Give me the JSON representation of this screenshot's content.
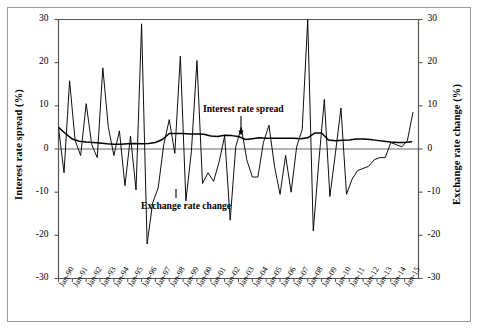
{
  "chart_data": {
    "type": "line",
    "title": "",
    "xlabel": "",
    "ylabel": "Interest rate spread (%)",
    "y2label": "Exchange rate change (%)",
    "ylim": [
      -30,
      30
    ],
    "y2lim": [
      -30,
      30
    ],
    "yticks": [
      30,
      20,
      10,
      0,
      -10,
      -20,
      -30
    ],
    "y2ticks": [
      30,
      20,
      10,
      0,
      -10,
      -20,
      -30
    ],
    "grid": false,
    "legend_position": "inline-annotations",
    "categories": [
      "Jan-90",
      "Jan-91",
      "Jan-92",
      "Jan-93",
      "Jan-94",
      "Jan-95",
      "Jan-96",
      "Jan-97",
      "Jan-98",
      "Jan-99",
      "Jan-00",
      "Jan-01",
      "Jan-02",
      "Jan-03",
      "Jan-04",
      "Jan-05",
      "Jan-06",
      "Jan-07",
      "Jan-08",
      "Jan-09",
      "Jan-10",
      "Jan-11",
      "Jan-12",
      "Jan-13",
      "Jan-14",
      "Jan-15"
    ],
    "annotations": [
      {
        "text": "Interest rate spread",
        "series": "Interest rate spread",
        "x": "Jan-03",
        "marker": "down-arrow"
      },
      {
        "text": "Exchange rate change",
        "series": "Exchange rate change",
        "x": "Jan-96",
        "marker": "tick"
      }
    ],
    "series": [
      {
        "name": "Interest rate spread",
        "axis": "left",
        "color": "#000000",
        "x": [
          1990.0,
          1990.5,
          1991.0,
          1991.5,
          1992.0,
          1992.5,
          1993.0,
          1993.5,
          1994.0,
          1994.5,
          1995.0,
          1995.5,
          1996.0,
          1996.5,
          1997.0,
          1997.5,
          1998.0,
          1998.5,
          1999.0,
          1999.5,
          2000.0,
          2000.5,
          2001.0,
          2001.5,
          2002.0,
          2002.5,
          2003.0,
          2003.5,
          2004.0,
          2004.5,
          2005.0,
          2005.5,
          2006.0,
          2006.5,
          2007.0,
          2007.5,
          2008.0,
          2008.5,
          2009.0,
          2009.5,
          2010.0,
          2010.5,
          2011.0,
          2011.5,
          2012.0,
          2012.5,
          2013.0,
          2013.5,
          2014.0,
          2014.5,
          2015.0,
          2015.5
        ],
        "values": [
          5.0,
          3.6,
          2.3,
          1.8,
          1.6,
          1.5,
          1.4,
          1.2,
          1.1,
          1.1,
          1.2,
          1.3,
          1.2,
          1.3,
          1.5,
          2.2,
          3.6,
          3.6,
          3.6,
          3.5,
          3.5,
          3.4,
          3.0,
          2.9,
          3.2,
          3.1,
          2.9,
          2.2,
          2.4,
          2.6,
          2.5,
          2.5,
          2.5,
          2.5,
          2.5,
          2.4,
          2.6,
          3.7,
          3.7,
          2.1,
          1.9,
          2.0,
          2.1,
          2.3,
          2.3,
          2.2,
          2.0,
          1.8,
          1.6,
          1.5,
          1.5,
          1.7
        ]
      },
      {
        "name": "Exchange rate change",
        "axis": "right",
        "color": "#000000",
        "x": [
          1990.0,
          1990.4,
          1990.8,
          1991.2,
          1991.6,
          1992.0,
          1992.4,
          1992.8,
          1993.2,
          1993.6,
          1994.0,
          1994.4,
          1994.8,
          1995.2,
          1995.6,
          1996.0,
          1996.4,
          1996.8,
          1997.2,
          1997.6,
          1998.0,
          1998.4,
          1998.8,
          1999.2,
          1999.6,
          2000.0,
          2000.4,
          2000.8,
          2001.2,
          2001.6,
          2002.0,
          2002.4,
          2002.8,
          2003.2,
          2003.6,
          2004.0,
          2004.4,
          2004.8,
          2005.2,
          2005.6,
          2006.0,
          2006.4,
          2006.8,
          2007.2,
          2007.6,
          2008.0,
          2008.4,
          2008.8,
          2009.2,
          2009.6,
          2010.0,
          2010.4,
          2010.8,
          2011.2,
          2011.6,
          2012.0,
          2012.4,
          2012.8,
          2013.2,
          2013.6,
          2014.0,
          2014.4,
          2014.8,
          2015.2,
          2015.6
        ],
        "values": [
          5.0,
          -5.5,
          15.8,
          2.0,
          -1.5,
          10.5,
          1.0,
          -2.0,
          18.8,
          5.0,
          -1.5,
          4.2,
          -8.5,
          3.0,
          -9.5,
          29.0,
          -22.0,
          -12.5,
          -9.0,
          1.0,
          6.8,
          -1.0,
          21.5,
          -12.0,
          -0.5,
          20.5,
          -8.0,
          -5.5,
          -7.5,
          -3.0,
          3.0,
          -16.5,
          0.5,
          5.0,
          -2.5,
          -6.5,
          -6.5,
          1.5,
          5.5,
          -4.0,
          -10.5,
          -1.5,
          -10.0,
          0.5,
          4.5,
          30.0,
          -19.0,
          -3.0,
          11.5,
          -11.0,
          -1.0,
          9.5,
          -10.5,
          -7.0,
          -5.0,
          -4.5,
          -4.0,
          -2.5,
          -2.0,
          -2.0,
          1.5,
          1.0,
          0.5,
          2.0,
          8.5
        ]
      }
    ]
  },
  "axes": {
    "left_title": "Interest rate spread (%)",
    "right_title": "Exchange rate change (%)",
    "left_ticks": [
      "30",
      "20",
      "10",
      "0",
      "-10",
      "-20",
      "-30"
    ],
    "right_ticks": [
      "30",
      "20",
      "10",
      "0",
      "-10",
      "-20",
      "-30"
    ],
    "x_ticks": [
      "Jan-90",
      "Jan-91",
      "Jan-92",
      "Jan-93",
      "Jan-94",
      "Jan-95",
      "Jan-96",
      "Jan-97",
      "Jan-98",
      "Jan-99",
      "Jan-00",
      "Jan-01",
      "Jan-02",
      "Jan-03",
      "Jan-04",
      "Jan-05",
      "Jan-06",
      "Jan-07",
      "Jan-08",
      "Jan-09",
      "Jan-10",
      "Jan-11",
      "Jan-12",
      "Jan-13",
      "Jan-14",
      "Jan-15"
    ]
  },
  "annotations": {
    "interest_rate_spread": "Interest rate spread",
    "exchange_rate_change": "Exchange rate change"
  },
  "colors": {
    "line": "#000000",
    "axis": "#555555",
    "frame": "#9a9a9a",
    "background": "#ffffff"
  }
}
